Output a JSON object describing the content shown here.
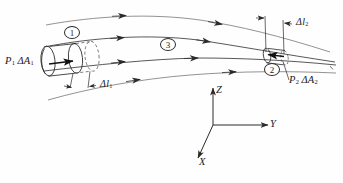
{
  "figure": {
    "background_color": "#fefefe",
    "line_color": "#3a3a3a",
    "text_color": "#1a1a1a"
  },
  "labels": {
    "force_inlet": {
      "text": "P1 ΔA1",
      "p": "P",
      "p_sub": "1",
      "delta_a": "ΔA",
      "a_sub": "1"
    },
    "force_outlet": {
      "text": "P2 ΔA2",
      "p": "P",
      "p_sub": "2",
      "delta_a": "ΔA",
      "a_sub": "2"
    },
    "displacement_inlet": {
      "text": "Δl1",
      "delta_l": "Δl",
      "sub": "1"
    },
    "displacement_outlet": {
      "text": "Δl2",
      "delta_l": "Δl",
      "sub": "2"
    }
  },
  "callouts": [
    {
      "id": "1",
      "label": "1",
      "meaning": "inlet-element"
    },
    {
      "id": "2",
      "label": "2",
      "meaning": "outlet-element"
    },
    {
      "id": "3",
      "label": "3",
      "meaning": "stream-tube-interior"
    }
  ],
  "axes": {
    "x": {
      "label": "X",
      "direction": "down-left"
    },
    "y": {
      "label": "Y",
      "direction": "right"
    },
    "z": {
      "label": "Z",
      "direction": "up"
    }
  },
  "streamlines": {
    "count": 4,
    "arrowheads_per_line": [
      2,
      3,
      3,
      2
    ],
    "direction": "left-to-right"
  }
}
